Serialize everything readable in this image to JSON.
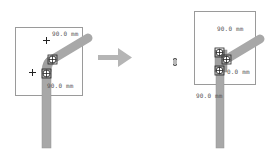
{
  "diagram": {
    "left_panel": {
      "label_top": "90.0 mm",
      "label_bottom": "90.0 mm"
    },
    "arrow": {
      "direction": "right",
      "color": "#b5b5b5"
    },
    "cursor_icon": "resize-cursor",
    "right_panel": {
      "label_top": "90.0 mm",
      "label_middle": "0.0 mm",
      "label_bottom": "90.0 mm"
    },
    "colors": {
      "pipe": "#a8a8a8",
      "pipe_edge": "#8c8c8c",
      "frame": "#9a9a9a",
      "text": "#555555"
    }
  }
}
